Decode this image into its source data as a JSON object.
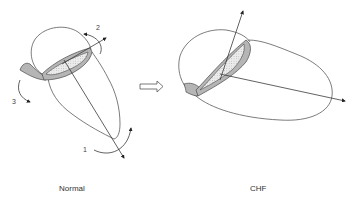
{
  "figure": {
    "panels": [
      {
        "id": "normal",
        "caption": "Normal",
        "motion_labels": [
          "1",
          "2",
          "3"
        ]
      },
      {
        "id": "chf",
        "caption": "CHF"
      }
    ],
    "transition": "right-arrow",
    "colors": {
      "outline": "#5a5a5a",
      "annulus_band": "#b5b5b5",
      "arrows": "#3a3a3a",
      "background": "#ffffff"
    }
  },
  "labels": {
    "normal": "Normal",
    "chf": "CHF",
    "motion_1": "1",
    "motion_2": "2",
    "motion_3": "3"
  }
}
